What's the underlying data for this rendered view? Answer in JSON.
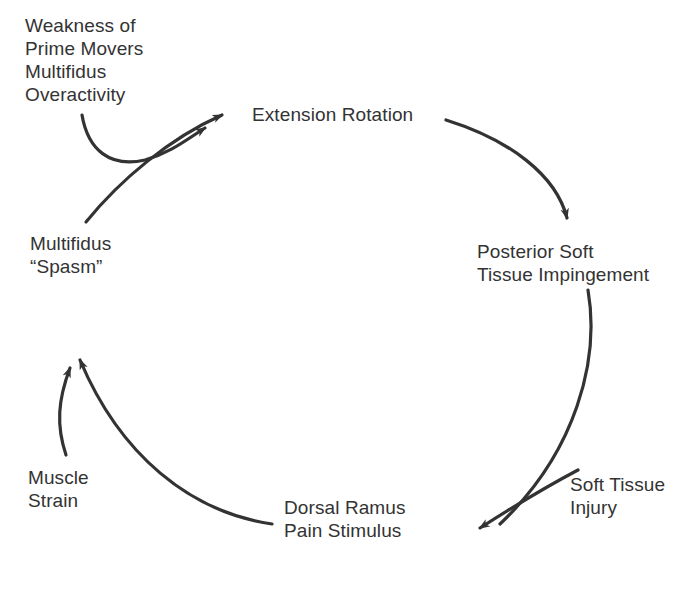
{
  "diagram": {
    "stroke_color": "#333333",
    "text_color": "#333333",
    "background_color": "#ffffff",
    "nodes": [
      {
        "id": "weakness",
        "name": "weakness-prime-movers",
        "text": "Weakness of\nPrime Movers\nMultifidus\nOveractivity",
        "role": "contributing-factor"
      },
      {
        "id": "extension",
        "name": "extension-rotation",
        "text": "Extension Rotation",
        "role": "cycle-node"
      },
      {
        "id": "posterior",
        "name": "posterior-soft-tissue-impingement",
        "text": "Posterior Soft\nTissue Impingement",
        "role": "cycle-node"
      },
      {
        "id": "soft_tissue_injury",
        "name": "soft-tissue-injury",
        "text": "Soft Tissue\nInjury",
        "role": "contributing-factor"
      },
      {
        "id": "dorsal",
        "name": "dorsal-ramus-pain-stimulus",
        "text": "Dorsal Ramus\nPain Stimulus",
        "role": "cycle-node"
      },
      {
        "id": "muscle_strain",
        "name": "muscle-strain",
        "text": "Muscle\nStrain",
        "role": "contributing-factor"
      },
      {
        "id": "multifidus",
        "name": "multifidus-spasm",
        "text": "Multifidus\n“Spasm”",
        "role": "cycle-node"
      }
    ],
    "edges": [
      {
        "from": "multifidus",
        "to": "extension",
        "kind": "cycle-arc"
      },
      {
        "from": "extension",
        "to": "posterior",
        "kind": "cycle-arc"
      },
      {
        "from": "posterior",
        "to": "dorsal",
        "kind": "cycle-arc"
      },
      {
        "from": "dorsal",
        "to": "multifidus",
        "kind": "cycle-arc"
      },
      {
        "from": "weakness",
        "to": "extension",
        "kind": "input-arrow"
      },
      {
        "from": "soft_tissue_injury",
        "to": "dorsal",
        "kind": "input-arrow"
      },
      {
        "from": "muscle_strain",
        "to": "multifidus",
        "kind": "input-arrow"
      }
    ]
  }
}
